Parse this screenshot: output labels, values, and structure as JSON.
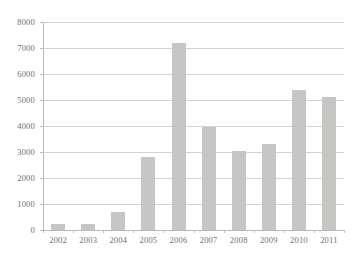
{
  "chart_data": {
    "type": "bar",
    "title": "",
    "subtitle": "",
    "xlabel": "",
    "ylabel": "",
    "categories": [
      "2002",
      "2003",
      "2004",
      "2005",
      "2006",
      "2007",
      "2008",
      "2009",
      "2010",
      "2011"
    ],
    "values": [
      220,
      250,
      690,
      2800,
      7200,
      3950,
      3050,
      3300,
      5400,
      5120
    ],
    "series": [
      {
        "name": "",
        "values": [
          220,
          250,
          690,
          2800,
          7200,
          3950,
          3050,
          3300,
          5400,
          5120
        ]
      }
    ],
    "ylim": [
      0,
      8000
    ],
    "y_ticks": [
      0,
      1000,
      2000,
      3000,
      4000,
      5000,
      6000,
      7000,
      8000
    ],
    "y_tick_labels": [
      "0",
      "1000",
      "2000",
      "3000",
      "4000",
      "5000",
      "6000",
      "7000",
      "8000"
    ],
    "x_tick_labels": [
      "2002",
      "2003",
      "2004",
      "2005",
      "2006",
      "2007",
      "2008",
      "2009",
      "2010",
      "2011"
    ],
    "grid": true,
    "grid_axis": "y",
    "legend": false,
    "legend_position": "none",
    "annotations": [],
    "colors": {
      "bar_fill": "#c6c6c4",
      "gridline": "#d2d2d2",
      "axis_line": "#b9b9b9",
      "tick_label": "#6f6f6f",
      "background": "#ffffff"
    }
  }
}
